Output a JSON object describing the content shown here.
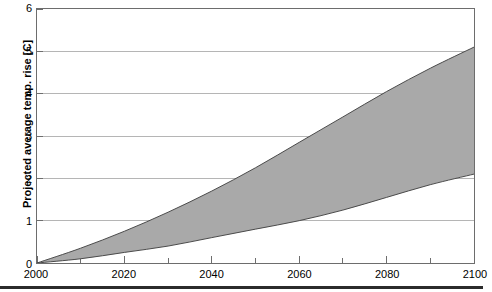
{
  "chart_data": {
    "type": "area",
    "title": "",
    "subtitle": "",
    "xlabel": "",
    "ylabel": "Projected average temp. rise [C]",
    "xlim": [
      2000,
      2100
    ],
    "ylim": [
      0,
      6
    ],
    "grid": true,
    "legend": false,
    "legend_position": "none",
    "band_fill_color": "#a9a9a9",
    "band_edge_color": "#4a4a4a",
    "grid_color": "#b4b4b4",
    "axis_color": "#6d6d6d",
    "x": [
      2000,
      2010,
      2020,
      2030,
      2040,
      2050,
      2060,
      2070,
      2080,
      2090,
      2100
    ],
    "series": [
      {
        "name": "High scenario (upper bound)",
        "values": [
          0.0,
          0.35,
          0.75,
          1.2,
          1.7,
          2.25,
          2.85,
          3.45,
          4.05,
          4.6,
          5.1
        ]
      },
      {
        "name": "Low scenario (lower bound)",
        "values": [
          0.0,
          0.1,
          0.25,
          0.4,
          0.6,
          0.8,
          1.0,
          1.25,
          1.55,
          1.85,
          2.1
        ]
      }
    ],
    "yticks": [
      {
        "value": 6,
        "label": "6"
      },
      {
        "value": 5,
        "label": "5"
      },
      {
        "value": 4,
        "label": "4"
      },
      {
        "value": 3,
        "label": "3"
      },
      {
        "value": 2,
        "label": "2"
      },
      {
        "value": 1,
        "label": "1"
      },
      {
        "value": 0,
        "label": "0"
      }
    ],
    "xticks": [
      {
        "value": 2000,
        "label": "2000"
      },
      {
        "value": 2020,
        "label": "2020"
      },
      {
        "value": 2040,
        "label": "2040"
      },
      {
        "value": 2060,
        "label": "2060"
      },
      {
        "value": 2080,
        "label": "2080"
      },
      {
        "value": 2100,
        "label": "2100"
      }
    ],
    "xminor_step": 10
  }
}
